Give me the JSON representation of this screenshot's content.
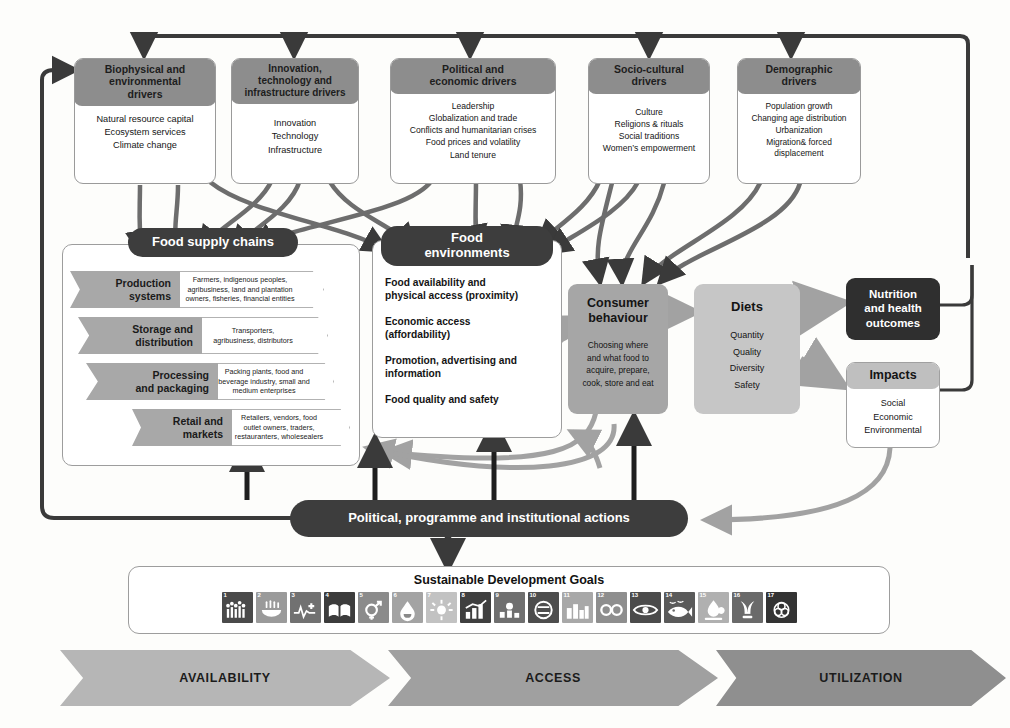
{
  "figure": {
    "colors": {
      "driver_header": "#8d8d8d",
      "pill_dark": "#3d3d3d",
      "box_dark": "#2f2f2f",
      "box_grey": "#a6a6a6",
      "box_light_grey": "#c6c6c6",
      "chevron_grey": "#a8a8a8",
      "arrow_dark": "#3a3a3a",
      "arrow_grey": "#a2a2a2",
      "banner_availability": "#b6b6b6",
      "banner_access": "#a0a0a0",
      "banner_utilization": "#8f8f8f"
    }
  },
  "drivers": [
    {
      "title": "Biophysical and environmental drivers",
      "title_lines": [
        "Biophysical and",
        "environmental",
        "drivers"
      ],
      "items": [
        "Natural resource capital",
        "Ecosystem services",
        "Climate change"
      ]
    },
    {
      "title": "Innovation, technology and infrastructure drivers",
      "title_lines": [
        "Innovation,",
        "technology and",
        "infrastructure drivers"
      ],
      "items": [
        "Innovation",
        "Technology",
        "Infrastructure"
      ]
    },
    {
      "title": "Political and economic drivers",
      "title_lines": [
        "Political and",
        "economic drivers"
      ],
      "items": [
        "Leadership",
        "Globalization and trade",
        "Conflicts and humanitarian crises",
        "Food prices and volatility",
        "Land tenure"
      ]
    },
    {
      "title": "Socio-cultural drivers",
      "title_lines": [
        "Socio-cultural",
        "drivers"
      ],
      "items": [
        "Culture",
        "Religions & rituals",
        "Social traditions",
        "Women’s empowerment"
      ]
    },
    {
      "title": "Demographic drivers",
      "title_lines": [
        "Demographic",
        "drivers"
      ],
      "items": [
        "Population growth",
        "Changing age distribution",
        "Urbanization",
        "Migration& forced",
        "displacement"
      ]
    }
  ],
  "food_supply_chains": {
    "label": "Food supply chains",
    "stages": [
      {
        "name": "Production systems",
        "name_lines": [
          "Production",
          "systems"
        ],
        "actors": "Farmers, indigenous peoples, agribusiness, land and plantation owners, fisheries, financial entities",
        "actor_lines": [
          "Farmers, indigenous peoples,",
          "agribusiness, land and plantation",
          "owners, fisheries, financial entities"
        ]
      },
      {
        "name": "Storage and distribution",
        "name_lines": [
          "Storage and",
          "distribution"
        ],
        "actors": "Transporters, agribusiness, distributors",
        "actor_lines": [
          "Transporters,",
          "agribusiness, distributors"
        ]
      },
      {
        "name": "Processing and packaging",
        "name_lines": [
          "Processing",
          "and packaging"
        ],
        "actors": "Packing plants, food and beverage industry, small and medium enterprises",
        "actor_lines": [
          "Packing plants, food and",
          "beverage industry, small and",
          "medium enterprises"
        ]
      },
      {
        "name": "Retail and markets",
        "name_lines": [
          "Retail and",
          "markets"
        ],
        "actors": "Retailers, vendors, food outlet owners, traders, restauranters, wholesealers",
        "actor_lines": [
          "Retailers, vendors, food",
          "outlet owners, traders,",
          "restauranters, wholesealers"
        ]
      }
    ]
  },
  "food_environments": {
    "label": "Food environments",
    "label_lines": [
      "Food",
      "environments"
    ],
    "items": [
      [
        "Food availability and",
        "physical access (proximity)"
      ],
      [
        "Economic access",
        "(affordability)"
      ],
      [
        "Promotion, advertising and",
        "information"
      ],
      [
        "Food quality and safety"
      ]
    ]
  },
  "consumer_behaviour": {
    "title_lines": [
      "Consumer",
      "behaviour"
    ],
    "subtitle_lines": [
      "Choosing where",
      "and what food to",
      "acquire, prepare,",
      "cook, store and eat"
    ]
  },
  "diets": {
    "title": "Diets",
    "items": [
      "Quantity",
      "Quality",
      "Diversity",
      "Safety"
    ]
  },
  "nutrition": {
    "title_lines": [
      "Nutrition",
      "and health",
      "outcomes"
    ]
  },
  "impacts": {
    "title": "Impacts",
    "items": [
      "Social",
      "Economic",
      "Environmental"
    ]
  },
  "actions": {
    "label": "Political, programme and institutional actions"
  },
  "sdg": {
    "title": "Sustainable Development Goals",
    "goals": [
      {
        "num": "1",
        "icon": "no-poverty-icon",
        "color": "#4a4a4a"
      },
      {
        "num": "2",
        "icon": "zero-hunger-icon",
        "color": "#9a9a9a"
      },
      {
        "num": "3",
        "icon": "good-health-icon",
        "color": "#717171"
      },
      {
        "num": "4",
        "icon": "quality-education-icon",
        "color": "#3c3c3c"
      },
      {
        "num": "5",
        "icon": "gender-equality-icon",
        "color": "#8b8b8b"
      },
      {
        "num": "6",
        "icon": "clean-water-icon",
        "color": "#a3a3a3"
      },
      {
        "num": "7",
        "icon": "affordable-energy-icon",
        "color": "#c2c2c2"
      },
      {
        "num": "8",
        "icon": "decent-work-icon",
        "color": "#3f3f3f"
      },
      {
        "num": "9",
        "icon": "industry-innovation-icon",
        "color": "#6f6f6f"
      },
      {
        "num": "10",
        "icon": "reduced-inequalities-icon",
        "color": "#4d4d4d"
      },
      {
        "num": "11",
        "icon": "sustainable-cities-icon",
        "color": "#a8a8a8"
      },
      {
        "num": "12",
        "icon": "responsible-consumption-icon",
        "color": "#8e8e8e"
      },
      {
        "num": "13",
        "icon": "climate-action-icon",
        "color": "#4b4b4b"
      },
      {
        "num": "14",
        "icon": "life-below-water-icon",
        "color": "#5a5a5a"
      },
      {
        "num": "15",
        "icon": "life-on-land-icon",
        "color": "#b0b0b0"
      },
      {
        "num": "16",
        "icon": "peace-justice-icon",
        "color": "#6a6a6a"
      },
      {
        "num": "17",
        "icon": "partnerships-icon",
        "color": "#333333"
      }
    ]
  },
  "banners": [
    {
      "label": "AVAILABILITY",
      "color": "#b6b6b6"
    },
    {
      "label": "ACCESS",
      "color": "#a0a0a0"
    },
    {
      "label": "UTILIZATION",
      "color": "#8f8f8f"
    }
  ]
}
